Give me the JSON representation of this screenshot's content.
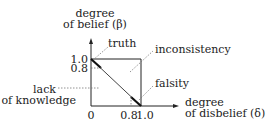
{
  "diagram": {
    "y_axis": {
      "line1": "degree",
      "line2": "of belief (β)"
    },
    "x_axis": {
      "line1": "degree",
      "line2": "of disbelief (δ)"
    },
    "ticks": {
      "y_top": "1.0",
      "y_mid": "0.8",
      "x_zero": "0",
      "x_mid": "0.8",
      "x_top": "1.0"
    },
    "annotations": {
      "truth": "truth",
      "inconsistency": "inconsistency",
      "falsity": "falsity",
      "lack1": "lack",
      "lack2": "of knowledge"
    }
  }
}
